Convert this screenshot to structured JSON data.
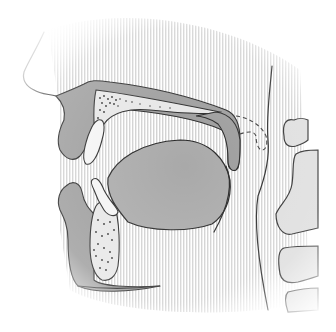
{
  "diagram": {
    "type": "anatomical-sagittal-section",
    "structures": [
      {
        "id": "nose",
        "label": ""
      },
      {
        "id": "upper-lip",
        "label": ""
      },
      {
        "id": "hard-palate",
        "label": ""
      },
      {
        "id": "soft-palate",
        "label": ""
      },
      {
        "id": "upper-incisor",
        "label": ""
      },
      {
        "id": "lower-incisor",
        "label": ""
      },
      {
        "id": "tongue",
        "label": ""
      },
      {
        "id": "mandible",
        "label": ""
      },
      {
        "id": "lower-lip",
        "label": ""
      },
      {
        "id": "pharynx-wall",
        "label": ""
      },
      {
        "id": "cervical-vertebrae",
        "label": ""
      }
    ],
    "colors": {
      "tissue": "#9a9a9a",
      "bone": "#e6e6e6",
      "tooth": "#f4f4f4",
      "tongue": "#a9a9a9",
      "outline": "#222222",
      "shading": "#cfcfcf"
    }
  }
}
